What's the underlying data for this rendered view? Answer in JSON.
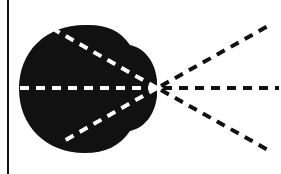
{
  "diagram": {
    "colors": {
      "background": "#ffffff",
      "shape": "#111111",
      "inner_dashes": "#ffffff",
      "outer_dashes": "#111111",
      "border": "#111111"
    },
    "focal_point": {
      "x": 157,
      "y": 88
    },
    "rays": [
      {
        "name": "upper",
        "inner_end": [
          55,
          30
        ],
        "outer_end": [
          268,
          26
        ]
      },
      {
        "name": "middle",
        "inner_end": [
          19,
          88
        ],
        "outer_end": [
          279,
          88
        ]
      },
      {
        "name": "lower",
        "inner_end": [
          62,
          142
        ],
        "outer_end": [
          268,
          150
        ]
      }
    ]
  }
}
